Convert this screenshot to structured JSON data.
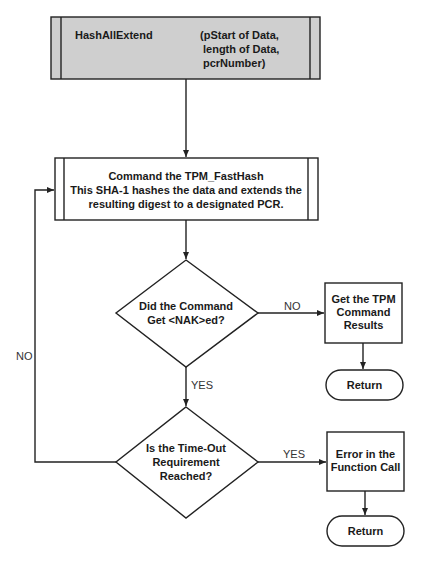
{
  "diagram": {
    "start_box": {
      "name": "HashAllExtend",
      "params": [
        "(pStart of Data,",
        "length of Data,",
        "pcrNumber)"
      ],
      "fill": "#cfcfcf"
    },
    "process_box": {
      "lines": [
        "Command the TPM_FastHash",
        "This SHA-1 hashes the data and extends the",
        "resulting digest to a designated PCR."
      ]
    },
    "decision_1": {
      "lines": [
        "Did the Command",
        "Get <NAK>ed?"
      ],
      "no_label": "NO",
      "yes_label": "YES"
    },
    "result_box": {
      "lines": [
        "Get the TPM",
        "Command",
        "Results"
      ]
    },
    "return_1": {
      "label": "Return"
    },
    "decision_2": {
      "lines": [
        "Is the Time-Out",
        "Requirement",
        "Reached?"
      ],
      "yes_label": "YES",
      "no_label": "NO"
    },
    "error_box": {
      "lines": [
        "Error in the",
        "Function Call"
      ]
    },
    "return_2": {
      "label": "Return"
    }
  },
  "colors": {
    "stroke": "#222222",
    "start_fill": "#cfcfcf",
    "background": "#ffffff"
  }
}
